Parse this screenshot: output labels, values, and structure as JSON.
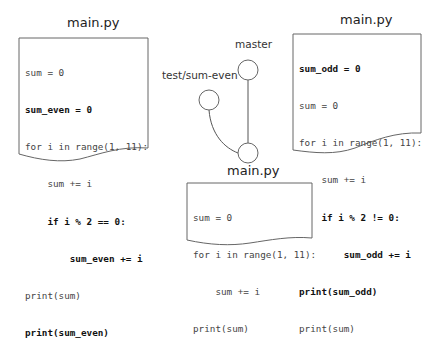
{
  "diagram": {
    "type": "git-branch-illustration",
    "colors": {
      "stroke": "#555555",
      "text": "#333333",
      "background": "#ffffff"
    },
    "left_file": {
      "title": "main.py",
      "lines": [
        {
          "text": "sum = 0",
          "bold": false
        },
        {
          "text": "sum_even = 0",
          "bold": true
        },
        {
          "text": "for i in range(1, 11):",
          "bold": false
        },
        {
          "text": "    sum += i",
          "bold": false
        },
        {
          "text": "    if i % 2 == 0:",
          "bold": true
        },
        {
          "text": "        sum_even += i",
          "bold": true
        },
        {
          "text": "print(sum)",
          "bold": false
        },
        {
          "text": "print(sum_even)",
          "bold": true
        }
      ]
    },
    "right_file": {
      "title": "main.py",
      "lines": [
        {
          "text": "sum_odd = 0",
          "bold": true
        },
        {
          "text": "sum = 0",
          "bold": false
        },
        {
          "text": "for i in range(1, 11):",
          "bold": false
        },
        {
          "text": "    sum += i",
          "bold": false
        },
        {
          "text": "    if i % 2 != 0:",
          "bold": true
        },
        {
          "text": "        sum_odd += i",
          "bold": true
        },
        {
          "text": "print(sum_odd)",
          "bold": true
        },
        {
          "text": "print(sum)",
          "bold": false
        }
      ]
    },
    "bottom_file": {
      "title": "main.py",
      "lines": [
        {
          "text": "sum = 0",
          "bold": false
        },
        {
          "text": "for i in range(1, 11):",
          "bold": false
        },
        {
          "text": "    sum += i",
          "bold": false
        },
        {
          "text": "print(sum)",
          "bold": false
        }
      ]
    },
    "branches": {
      "master_label": "master",
      "feature_label": "test/sum-even"
    },
    "nodes": [
      {
        "id": "master-commit",
        "branch": "master"
      },
      {
        "id": "feature-commit",
        "branch": "test/sum-even"
      },
      {
        "id": "base-commit",
        "branch": "common-ancestor"
      }
    ]
  }
}
